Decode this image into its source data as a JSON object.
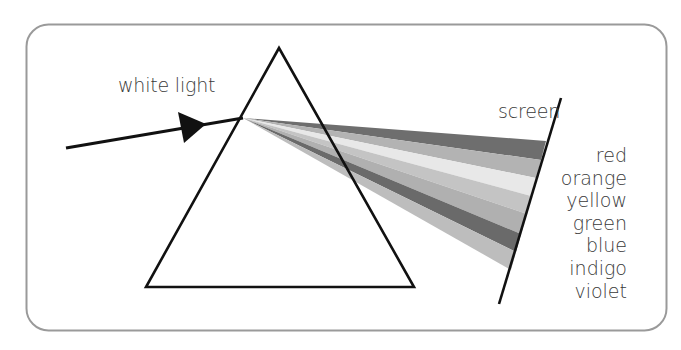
{
  "diagram": {
    "title_labels": {
      "incoming": "white light",
      "screen": "screen"
    },
    "spectrum": [
      {
        "name": "red",
        "shade": "#6e6e6e"
      },
      {
        "name": "orange",
        "shade": "#b3b3b3"
      },
      {
        "name": "yellow",
        "shade": "#e6e6e6"
      },
      {
        "name": "green",
        "shade": "#c2c2c2"
      },
      {
        "name": "blue",
        "shade": "#b0b0b0"
      },
      {
        "name": "indigo",
        "shade": "#6a6a6a"
      },
      {
        "name": "violet",
        "shade": "#bdbdbd"
      }
    ],
    "colors": {
      "frame_stroke": "#9a9a9a",
      "line_stroke": "#111111",
      "text": "#3a3a3a"
    }
  }
}
